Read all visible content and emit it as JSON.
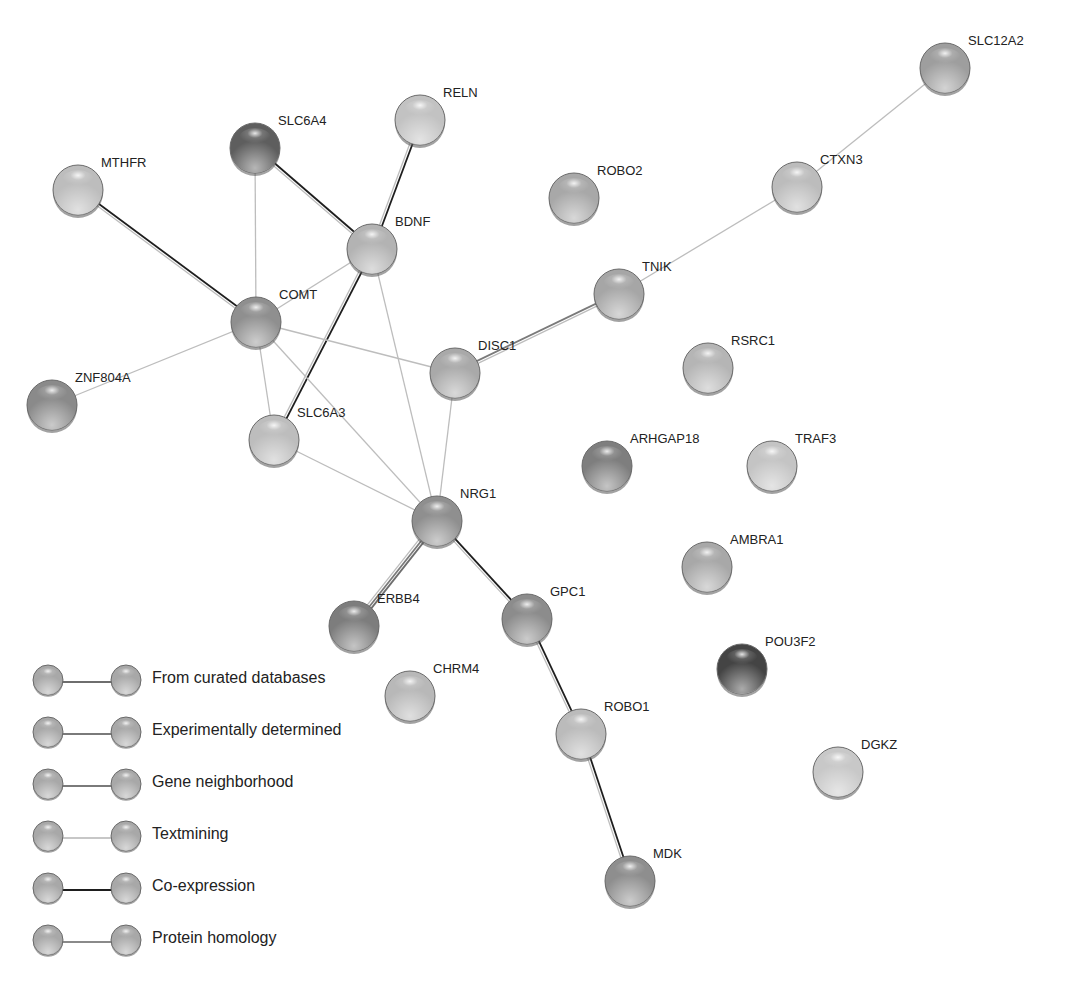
{
  "network": {
    "nodes": [
      {
        "id": "MTHFR",
        "label": "MTHFR",
        "x": 78,
        "y": 190,
        "shade": "#bdbdbd"
      },
      {
        "id": "SLC6A4",
        "label": "SLC6A4",
        "x": 255,
        "y": 148,
        "shade": "#5e5e5e"
      },
      {
        "id": "RELN",
        "label": "RELN",
        "x": 420,
        "y": 120,
        "shade": "#c2c2c2"
      },
      {
        "id": "ROBO2",
        "label": "ROBO2",
        "x": 574,
        "y": 198,
        "shade": "#a8a8a8"
      },
      {
        "id": "BDNF",
        "label": "BDNF",
        "x": 372,
        "y": 249,
        "shade": "#b3b3b3"
      },
      {
        "id": "SLC12A2",
        "label": "SLC12A2",
        "x": 945,
        "y": 68,
        "shade": "#9e9e9e"
      },
      {
        "id": "CTXN3",
        "label": "CTXN3",
        "x": 797,
        "y": 187,
        "shade": "#bcbcbc"
      },
      {
        "id": "TNIK",
        "label": "TNIK",
        "x": 619,
        "y": 294,
        "shade": "#a6a6a6"
      },
      {
        "id": "COMT",
        "label": "COMT",
        "x": 256,
        "y": 322,
        "shade": "#8f8f8f"
      },
      {
        "id": "DISC1",
        "label": "DISC1",
        "x": 455,
        "y": 373,
        "shade": "#a9a9a9"
      },
      {
        "id": "RSRC1",
        "label": "RSRC1",
        "x": 708,
        "y": 368,
        "shade": "#b5b5b5"
      },
      {
        "id": "ZNF804A",
        "label": "ZNF804A",
        "x": 52,
        "y": 405,
        "shade": "#8a8a8a"
      },
      {
        "id": "SLC6A3",
        "label": "SLC6A3",
        "x": 274,
        "y": 440,
        "shade": "#bdbdbd"
      },
      {
        "id": "ARHGAP18",
        "label": "ARHGAP18",
        "x": 607,
        "y": 466,
        "shade": "#7e7e7e"
      },
      {
        "id": "TRAF3",
        "label": "TRAF3",
        "x": 772,
        "y": 466,
        "shade": "#c4c4c4"
      },
      {
        "id": "NRG1",
        "label": "NRG1",
        "x": 437,
        "y": 521,
        "shade": "#8f8f8f"
      },
      {
        "id": "AMBRA1",
        "label": "AMBRA1",
        "x": 707,
        "y": 567,
        "shade": "#a8a8a8"
      },
      {
        "id": "ERBB4",
        "label": "ERBB4",
        "x": 354,
        "y": 626,
        "shade": "#7d7d7d"
      },
      {
        "id": "GPC1",
        "label": "GPC1",
        "x": 527,
        "y": 619,
        "shade": "#8c8c8c"
      },
      {
        "id": "POU3F2",
        "label": "POU3F2",
        "x": 742,
        "y": 669,
        "shade": "#444444"
      },
      {
        "id": "CHRM4",
        "label": "CHRM4",
        "x": 410,
        "y": 696,
        "shade": "#b8b8b8"
      },
      {
        "id": "ROBO1",
        "label": "ROBO1",
        "x": 581,
        "y": 734,
        "shade": "#bbbbbb"
      },
      {
        "id": "DGKZ",
        "label": "DGKZ",
        "x": 838,
        "y": 772,
        "shade": "#c8c8c8"
      },
      {
        "id": "MDK",
        "label": "MDK",
        "x": 630,
        "y": 881,
        "shade": "#8e8e8e"
      }
    ],
    "edges": [
      {
        "source": "MTHFR",
        "target": "COMT",
        "types": [
          "coexpression",
          "textmining"
        ]
      },
      {
        "source": "SLC6A4",
        "target": "BDNF",
        "types": [
          "coexpression",
          "textmining"
        ]
      },
      {
        "source": "SLC6A4",
        "target": "COMT",
        "types": [
          "textmining"
        ]
      },
      {
        "source": "RELN",
        "target": "BDNF",
        "types": [
          "coexpression",
          "textmining"
        ]
      },
      {
        "source": "BDNF",
        "target": "COMT",
        "types": [
          "textmining"
        ]
      },
      {
        "source": "BDNF",
        "target": "SLC6A3",
        "types": [
          "coexpression",
          "textmining"
        ]
      },
      {
        "source": "BDNF",
        "target": "NRG1",
        "types": [
          "textmining"
        ]
      },
      {
        "source": "COMT",
        "target": "ZNF804A",
        "types": [
          "textmining"
        ]
      },
      {
        "source": "COMT",
        "target": "DISC1",
        "types": [
          "textmining"
        ]
      },
      {
        "source": "COMT",
        "target": "SLC6A3",
        "types": [
          "textmining"
        ]
      },
      {
        "source": "COMT",
        "target": "NRG1",
        "types": [
          "textmining"
        ]
      },
      {
        "source": "SLC6A3",
        "target": "NRG1",
        "types": [
          "textmining"
        ]
      },
      {
        "source": "DISC1",
        "target": "TNIK",
        "types": [
          "experimental",
          "textmining"
        ]
      },
      {
        "source": "DISC1",
        "target": "NRG1",
        "types": [
          "textmining"
        ]
      },
      {
        "source": "TNIK",
        "target": "CTXN3",
        "types": [
          "textmining"
        ]
      },
      {
        "source": "CTXN3",
        "target": "SLC12A2",
        "types": [
          "textmining"
        ]
      },
      {
        "source": "NRG1",
        "target": "ERBB4",
        "types": [
          "curated",
          "experimental",
          "textmining"
        ]
      },
      {
        "source": "NRG1",
        "target": "GPC1",
        "types": [
          "coexpression",
          "textmining"
        ]
      },
      {
        "source": "GPC1",
        "target": "ROBO1",
        "types": [
          "coexpression",
          "textmining"
        ]
      },
      {
        "source": "ROBO1",
        "target": "MDK",
        "types": [
          "coexpression",
          "textmining"
        ]
      }
    ],
    "edge_colors": {
      "curated": "#6e6e6e",
      "experimental": "#7a7a7a",
      "neighborhood": "#7a7a7a",
      "textmining": "#bdbdbd",
      "coexpression": "#1e1e1e",
      "homology": "#8a8a8a"
    }
  },
  "legend": {
    "items": [
      {
        "label": "From curated databases",
        "type": "curated",
        "color": "#6e6e6e"
      },
      {
        "label": "Experimentally determined",
        "type": "experimental",
        "color": "#7a7a7a"
      },
      {
        "label": "Gene neighborhood",
        "type": "neighborhood",
        "color": "#7a7a7a"
      },
      {
        "label": "Textmining",
        "type": "textmining",
        "color": "#b5b5b5"
      },
      {
        "label": "Co-expression",
        "type": "coexpression",
        "color": "#1e1e1e"
      },
      {
        "label": "Protein homology",
        "type": "homology",
        "color": "#8a8a8a"
      }
    ]
  }
}
